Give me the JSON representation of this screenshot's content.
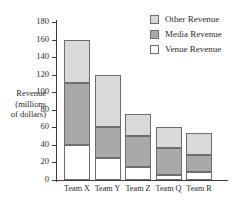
{
  "chart_data": {
    "type": "bar",
    "stacked": true,
    "title": "",
    "xlabel": "",
    "ylabel": "Revenue (millions of dollars)",
    "ylabel_lines": [
      "Revenue",
      "(millions",
      "of dollars)"
    ],
    "categories": [
      "Team X",
      "Team Y",
      "Team Z",
      "Team Q",
      "Team R"
    ],
    "series": [
      {
        "name": "Venue Revenue",
        "color": "#ffffff",
        "values": [
          40,
          25,
          15,
          6,
          9
        ]
      },
      {
        "name": "Media Revenue",
        "color": "#a9a9a9",
        "values": [
          70,
          35,
          35,
          30,
          19
        ]
      },
      {
        "name": "Other Revenue",
        "color": "#d9d9d9",
        "values": [
          50,
          60,
          25,
          24,
          26
        ]
      }
    ],
    "totals": [
      160,
      120,
      75,
      60,
      54
    ],
    "ylim": [
      0,
      180
    ],
    "yticks": [
      0,
      20,
      40,
      60,
      80,
      100,
      120,
      140,
      160,
      180
    ],
    "ytick_labels": [
      "0",
      "20",
      "40",
      "60",
      "80",
      "100",
      "120",
      "140",
      "160",
      "180"
    ],
    "grid": false,
    "legend_position": "top-right",
    "legend_order": [
      "Other Revenue",
      "Media Revenue",
      "Venue Revenue"
    ]
  },
  "legend": {
    "entries": [
      {
        "label": "Other Revenue",
        "color": "#d9d9d9"
      },
      {
        "label": "Media Revenue",
        "color": "#a9a9a9"
      },
      {
        "label": "Venue Revenue",
        "color": "#ffffff"
      }
    ]
  }
}
